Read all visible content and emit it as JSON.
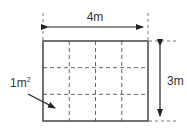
{
  "diagram": {
    "width_label": "4m",
    "height_label": "3m",
    "unit_square_label": "1m",
    "unit_square_exponent": "2",
    "grid": {
      "columns": 4,
      "rows": 3
    },
    "colors": {
      "line": "#444444",
      "dash": "#666666",
      "text": "#333333"
    }
  }
}
